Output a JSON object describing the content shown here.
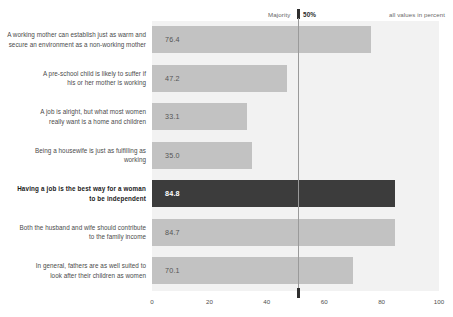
{
  "header": {
    "majority_label": "Majority",
    "majority_value": "50%",
    "unit_note": "all values in percent"
  },
  "axis": {
    "ticks": [
      "0",
      "20",
      "40",
      "60",
      "80",
      "100"
    ]
  },
  "chart_data": {
    "type": "bar",
    "orientation": "horizontal",
    "title": "",
    "subtitle": "",
    "xlabel": "",
    "ylabel": "",
    "xlim": [
      0,
      100
    ],
    "xticks": [
      0,
      20,
      40,
      60,
      80,
      100
    ],
    "grid": false,
    "legend": "none",
    "annotations": [
      {
        "text": "Majority",
        "value": 50
      },
      {
        "text": "50%",
        "value": 50
      },
      {
        "text": "all values in percent"
      }
    ],
    "highlight_index": 4,
    "colors": {
      "bar": "#c2c2c2",
      "bar_highlight": "#3c3c3c",
      "panel": "#f2f2f2",
      "value_label": "#555555",
      "value_label_highlight": "#ffffff",
      "majority_line": "#9a9a9a"
    },
    "categories": [
      "A working mother can establish just as warm and secure an environment as a non-working mother",
      "A pre-school child is likely to suffer if his or her mother is working",
      "A job is alright, but what most women really want is a home and children",
      "Being a housewife is just as fulfilling as working",
      "Having a job is the best way for a woman to be independent",
      "Both the husband and wife should contribute to the family income",
      "In general, fathers are as well suited to look after their children as women"
    ],
    "values": [
      76.4,
      47.2,
      33.1,
      35.0,
      84.8,
      84.7,
      70.1
    ],
    "value_labels": [
      "76.4",
      "47.2",
      "33.1",
      "35.0",
      "84.8",
      "84.7",
      "70.1"
    ]
  },
  "categories_wrapped": [
    [
      "A working mother can establish just as warm and",
      "secure an environment as a non-working mother"
    ],
    [
      "A pre-school child is likely to suffer if",
      "his or her mother is working"
    ],
    [
      "A job is alright, but what most women",
      "really want is a home and children"
    ],
    [
      "Being a housewife is just as fulfilling as",
      "working"
    ],
    [
      "Having a job is the best way for a woman",
      "to be independent"
    ],
    [
      "Both the husband and wife should contribute",
      "to the family income"
    ],
    [
      "In general, fathers are as well suited to",
      "look after their children as women"
    ]
  ]
}
